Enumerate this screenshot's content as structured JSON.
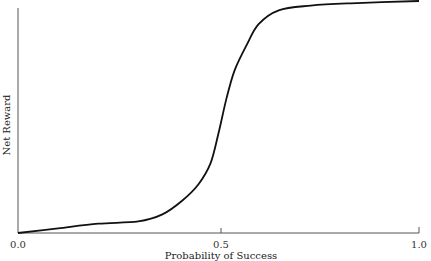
{
  "chart_data": {
    "type": "line",
    "title": "",
    "xlabel": "Probability of Success",
    "ylabel": "Net Reward",
    "xlim": [
      0.0,
      1.0
    ],
    "ylim": [
      0,
      1
    ],
    "grid": false,
    "legend": null,
    "x_ticks": [
      "0.0",
      "0.5",
      "1.0"
    ],
    "y_ticks": [],
    "series": [
      {
        "name": "Net Reward",
        "x": [
          0.0,
          0.1,
          0.2,
          0.3,
          0.36,
          0.41,
          0.45,
          0.48,
          0.5,
          0.52,
          0.54,
          0.57,
          0.6,
          0.65,
          0.73,
          0.83,
          1.0
        ],
        "y": [
          0.0,
          0.02,
          0.04,
          0.05,
          0.08,
          0.14,
          0.21,
          0.3,
          0.43,
          0.58,
          0.7,
          0.81,
          0.9,
          0.96,
          0.98,
          0.99,
          1.0
        ]
      }
    ]
  },
  "labels": {
    "x_axis": "Probability of Success",
    "y_axis": "Net Reward",
    "tick_0": "0.0",
    "tick_05": "0.5",
    "tick_1": "1.0"
  }
}
